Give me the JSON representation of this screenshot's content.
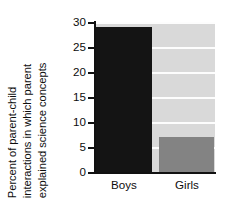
{
  "chart_data": {
    "type": "bar",
    "title": "",
    "xlabel": "",
    "ylabel": "Percent of parent-child interactions in which parent explained science concepts",
    "ylabel_lines": [
      "Percent of parent-child",
      "interactions in which parent",
      "explained science concepts"
    ],
    "categories": [
      "Boys",
      "Girls"
    ],
    "values": [
      29,
      7
    ],
    "ylim": [
      0,
      30
    ],
    "ytick_labels": [
      "0",
      "5",
      "10",
      "15",
      "20",
      "25",
      "30"
    ],
    "ytick_values": [
      0,
      5,
      10,
      15,
      20,
      25,
      30
    ],
    "grid": true,
    "legend": false,
    "colors": {
      "bar_boys": "#141414",
      "bar_girls": "#838383",
      "plot_background": "#d9d9d9",
      "gridline": "#fdfdfd",
      "axis": "#111111",
      "text": "#0d0d0d",
      "figure_background": "#ffffff"
    }
  }
}
